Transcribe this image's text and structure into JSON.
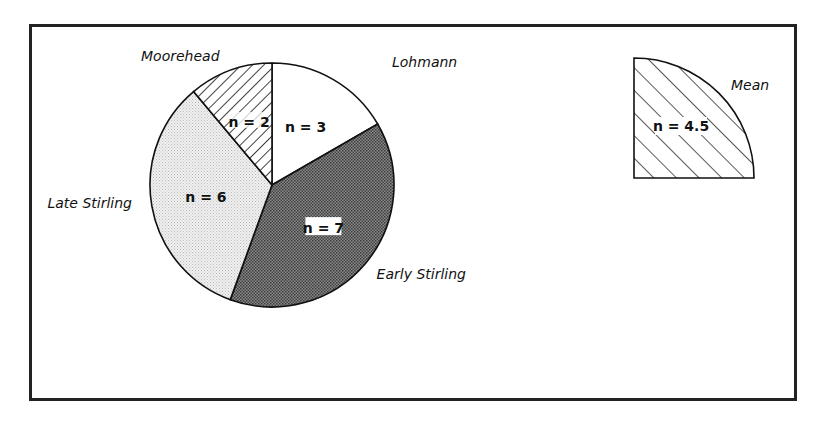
{
  "chart_data": {
    "type": "pie",
    "title": "",
    "slices": [
      {
        "name": "Lohmann",
        "value": 3,
        "label": "n = 3",
        "fill": "white"
      },
      {
        "name": "Early Stirling",
        "value": 7,
        "label": "n = 7",
        "fill": "dark-stipple"
      },
      {
        "name": "Late Stirling",
        "value": 6,
        "label": "n = 6",
        "fill": "light-stipple"
      },
      {
        "name": "Moorehead",
        "value": 2,
        "label": "n = 2",
        "fill": "hatch"
      }
    ],
    "start": "12 o'clock, clockwise",
    "mean": {
      "name": "Mean",
      "value": 4.5,
      "label": "n = 4.5",
      "fill": "hatch",
      "shape": "quarter-circle"
    }
  }
}
